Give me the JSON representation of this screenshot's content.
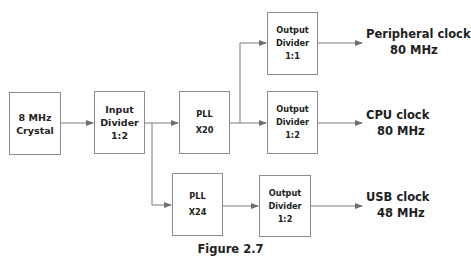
{
  "diagram": {
    "type": "clock-tree block diagram",
    "blocks": {
      "crystal": {
        "line1": "8 MHz",
        "line2": "Crystal"
      },
      "input_divider": {
        "line1": "Input",
        "line2": "Divider",
        "line3": "1:2"
      },
      "pll_x20": {
        "line1": "PLL",
        "line2": "X20"
      },
      "pll_x24": {
        "line1": "PLL",
        "line2": "X24"
      },
      "out_div_peripheral": {
        "line1": "Output",
        "line2": "Divider",
        "line3": "1:1"
      },
      "out_div_cpu": {
        "line1": "Output",
        "line2": "Divider",
        "line3": "1:2"
      },
      "out_div_usb": {
        "line1": "Output",
        "line2": "Divider",
        "line3": "1:2"
      }
    },
    "outputs": {
      "peripheral": {
        "name": "Peripheral clock",
        "freq": "80 MHz"
      },
      "cpu": {
        "name": "CPU clock",
        "freq": "80 MHz"
      },
      "usb": {
        "name": "USB clock",
        "freq": "48 MHz"
      }
    },
    "edges": [
      [
        "crystal",
        "input_divider"
      ],
      [
        "input_divider",
        "pll_x20"
      ],
      [
        "input_divider",
        "pll_x24"
      ],
      [
        "pll_x20",
        "out_div_peripheral"
      ],
      [
        "pll_x20",
        "out_div_cpu"
      ],
      [
        "pll_x24",
        "out_div_usb"
      ],
      [
        "out_div_peripheral",
        "peripheral"
      ],
      [
        "out_div_cpu",
        "cpu"
      ],
      [
        "out_div_usb",
        "usb"
      ]
    ],
    "caption": "Figure 2.7",
    "colors": {
      "line": "#7a7a7a",
      "border": "#8c8c8c",
      "text": "#222222"
    }
  }
}
